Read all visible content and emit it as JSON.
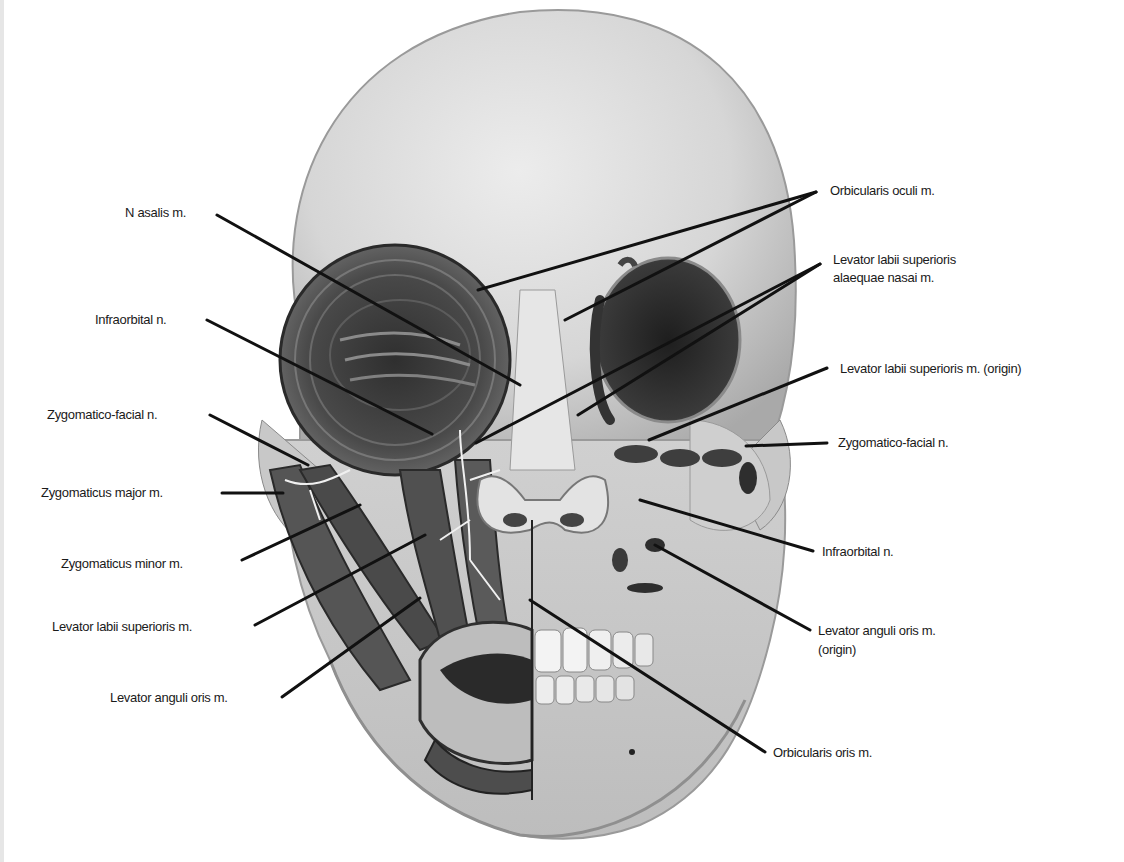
{
  "figure": {
    "type": "anatomical-diagram",
    "colors": {
      "background": "#ffffff",
      "bone": "#d9d9d9",
      "bone_shadow": "#a8a8a8",
      "muscle": "#5a5a5a",
      "muscle_dark": "#3a3a3a",
      "orbit": "#2e2e2e",
      "nerve": "#f2f2f2",
      "leader_line": "#111111",
      "label_text": "#1a1a1a"
    }
  },
  "labels": {
    "left": [
      {
        "id": "nasalis",
        "text": "N asalis m."
      },
      {
        "id": "infraorbital-left",
        "text": "Infraorbital n."
      },
      {
        "id": "zygomatico-facial-left",
        "text": "Zygomatico-facial n."
      },
      {
        "id": "zygomaticus-major",
        "text": "Zygomaticus major m."
      },
      {
        "id": "zygomaticus-minor",
        "text": "Zygomaticus minor m."
      },
      {
        "id": "levator-labii-superioris",
        "text": "Levator labii superioris m."
      },
      {
        "id": "levator-anguli-oris",
        "text": "Levator anguli oris m."
      }
    ],
    "right": [
      {
        "id": "orbicularis-oculi",
        "text": "Orbicularis oculi m."
      },
      {
        "id": "levator-labii-alaeque-line1",
        "text": "Levator labii superioris"
      },
      {
        "id": "levator-labii-alaeque-line2",
        "text": "alaequae nasai m."
      },
      {
        "id": "levator-labii-superioris-origin",
        "text": "Levator labii superioris m.  (origin)"
      },
      {
        "id": "zygomatico-facial-right",
        "text": "Zygomatico-facial n."
      },
      {
        "id": "infraorbital-right",
        "text": "Infraorbital n."
      },
      {
        "id": "levator-anguli-oris-origin-line1",
        "text": "Levator anguli oris m."
      },
      {
        "id": "levator-anguli-oris-origin-line2",
        "text": "(origin)"
      },
      {
        "id": "orbicularis-oris",
        "text": "Orbicularis oris m."
      }
    ]
  }
}
